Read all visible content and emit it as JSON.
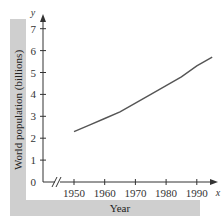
{
  "chart_data": {
    "type": "line",
    "title": "",
    "xlabel": "Year",
    "ylabel": "World population (billions)",
    "x_axis_var": "x",
    "y_axis_var": "y",
    "x_ticks": [
      "1950",
      "1960",
      "1970",
      "1980",
      "1990"
    ],
    "y_ticks": [
      "0",
      "1",
      "2",
      "3",
      "4",
      "5",
      "6",
      "7"
    ],
    "xlim": [
      1950,
      1995
    ],
    "ylim": [
      0,
      7
    ],
    "axis_break": true,
    "grid": false,
    "series": [
      {
        "name": "World population",
        "x": [
          1950,
          1955,
          1960,
          1965,
          1970,
          1975,
          1980,
          1985,
          1990,
          1995
        ],
        "values": [
          2.3,
          2.6,
          2.9,
          3.2,
          3.6,
          4.0,
          4.4,
          4.8,
          5.3,
          5.7
        ]
      }
    ]
  },
  "labels": {
    "ylabel": "World population (billions)",
    "xlabel": "Year",
    "x_var": "x",
    "y_var": "y"
  }
}
